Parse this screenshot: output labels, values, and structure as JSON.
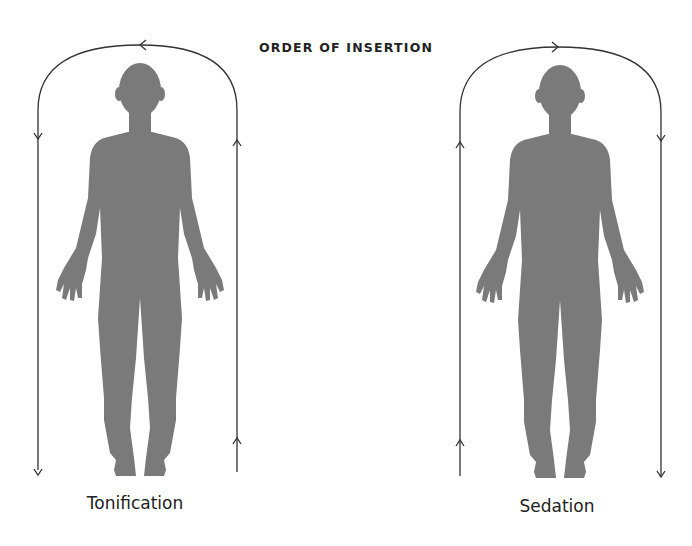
{
  "diagram": {
    "title": "ORDER OF INSERTION",
    "panels": [
      {
        "label": "Tonification",
        "direction": "counterclockwise: down the left side, up the right side, arc arrow pointing left",
        "figure": "human-silhouette"
      },
      {
        "label": "Sedation",
        "direction": "clockwise: up the left side, down the right side, arc arrow pointing right",
        "figure": "human-silhouette"
      }
    ],
    "colors": {
      "silhouette": "#7a7a7a",
      "line": "#333333",
      "text": "#222222",
      "background": "#ffffff"
    }
  }
}
